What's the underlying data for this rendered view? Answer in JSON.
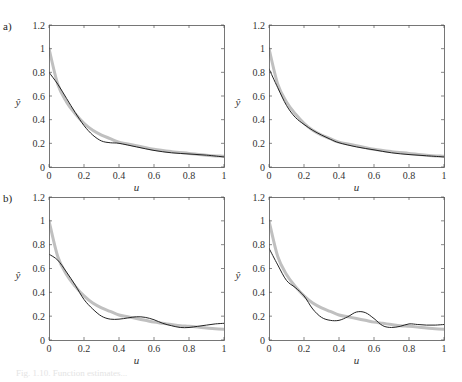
{
  "figure": {
    "panel_labels": [
      "a)",
      "b)"
    ],
    "caption": "Fig. 1.10. Function estimates..."
  },
  "chart_data": [
    {
      "type": "line",
      "panel": "a-left",
      "title": "",
      "xlabel": "u",
      "ylabel": "ŷ",
      "xlim": [
        0,
        1
      ],
      "ylim": [
        0,
        1.2
      ],
      "xticks": [
        "0",
        "0.2",
        "0.4",
        "0.6",
        "0.8",
        "1"
      ],
      "yticks": [
        "0",
        "0.2",
        "0.4",
        "0.6",
        "0.8",
        "1",
        "1.2"
      ],
      "grid": false,
      "x": [
        0,
        0.05,
        0.1,
        0.15,
        0.2,
        0.25,
        0.3,
        0.35,
        0.4,
        0.5,
        0.6,
        0.7,
        0.8,
        0.9,
        1.0
      ],
      "series": [
        {
          "name": "true function",
          "color": "#c0c0c0",
          "width": 3,
          "values": [
            1.0,
            0.7,
            0.55,
            0.45,
            0.37,
            0.31,
            0.27,
            0.24,
            0.21,
            0.18,
            0.15,
            0.13,
            0.115,
            0.1,
            0.09
          ]
        },
        {
          "name": "estimate",
          "color": "#222222",
          "width": 1,
          "values": [
            0.8,
            0.7,
            0.58,
            0.46,
            0.35,
            0.27,
            0.22,
            0.205,
            0.2,
            0.17,
            0.14,
            0.12,
            0.11,
            0.1,
            0.085
          ]
        }
      ]
    },
    {
      "type": "line",
      "panel": "a-right",
      "title": "",
      "xlabel": "u",
      "ylabel": "ŷ",
      "xlim": [
        0,
        1
      ],
      "ylim": [
        0,
        1.2
      ],
      "xticks": [
        "0",
        "0.2",
        "0.4",
        "0.6",
        "0.8",
        "1"
      ],
      "yticks": [
        "0",
        "0.2",
        "0.4",
        "0.6",
        "0.8",
        "1",
        "1.2"
      ],
      "grid": false,
      "x": [
        0,
        0.05,
        0.1,
        0.15,
        0.2,
        0.25,
        0.3,
        0.35,
        0.4,
        0.5,
        0.6,
        0.7,
        0.8,
        0.9,
        1.0
      ],
      "series": [
        {
          "name": "true function",
          "color": "#c0c0c0",
          "width": 3,
          "values": [
            1.0,
            0.7,
            0.55,
            0.45,
            0.37,
            0.31,
            0.27,
            0.24,
            0.21,
            0.18,
            0.15,
            0.13,
            0.115,
            0.1,
            0.09
          ]
        },
        {
          "name": "estimate",
          "color": "#222222",
          "width": 1,
          "values": [
            0.83,
            0.67,
            0.52,
            0.42,
            0.36,
            0.31,
            0.27,
            0.235,
            0.205,
            0.17,
            0.145,
            0.12,
            0.105,
            0.095,
            0.085
          ]
        }
      ]
    },
    {
      "type": "line",
      "panel": "b-left",
      "title": "",
      "xlabel": "u",
      "ylabel": "ŷ",
      "xlim": [
        0,
        1
      ],
      "ylim": [
        0,
        1.2
      ],
      "xticks": [
        "0",
        "0.2",
        "0.4",
        "0.6",
        "0.8",
        "1"
      ],
      "yticks": [
        "0",
        "0.2",
        "0.4",
        "0.6",
        "0.8",
        "1",
        "1.2"
      ],
      "grid": false,
      "x": [
        0,
        0.05,
        0.1,
        0.15,
        0.2,
        0.25,
        0.3,
        0.35,
        0.4,
        0.45,
        0.5,
        0.55,
        0.6,
        0.65,
        0.7,
        0.75,
        0.8,
        0.85,
        0.9,
        0.95,
        1.0
      ],
      "series": [
        {
          "name": "true function",
          "color": "#c0c0c0",
          "width": 3,
          "values": [
            1.0,
            0.7,
            0.55,
            0.45,
            0.37,
            0.31,
            0.27,
            0.24,
            0.21,
            0.195,
            0.18,
            0.165,
            0.15,
            0.14,
            0.13,
            0.12,
            0.115,
            0.108,
            0.1,
            0.095,
            0.09
          ]
        },
        {
          "name": "estimate",
          "color": "#222222",
          "width": 1,
          "values": [
            0.72,
            0.67,
            0.57,
            0.46,
            0.34,
            0.26,
            0.2,
            0.175,
            0.175,
            0.185,
            0.195,
            0.19,
            0.17,
            0.14,
            0.12,
            0.105,
            0.105,
            0.115,
            0.125,
            0.135,
            0.14
          ]
        }
      ]
    },
    {
      "type": "line",
      "panel": "b-right",
      "title": "",
      "xlabel": "u",
      "ylabel": "ŷ",
      "xlim": [
        0,
        1
      ],
      "ylim": [
        0,
        1.2
      ],
      "xticks": [
        "0",
        "0.2",
        "0.4",
        "0.6",
        "0.8",
        "1"
      ],
      "yticks": [
        "0",
        "0.2",
        "0.4",
        "0.6",
        "0.8",
        "1",
        "1.2"
      ],
      "grid": false,
      "x": [
        0,
        0.05,
        0.1,
        0.15,
        0.2,
        0.25,
        0.3,
        0.35,
        0.4,
        0.45,
        0.5,
        0.55,
        0.6,
        0.65,
        0.7,
        0.75,
        0.8,
        0.85,
        0.9,
        0.95,
        1.0
      ],
      "series": [
        {
          "name": "true function",
          "color": "#c0c0c0",
          "width": 3,
          "values": [
            1.0,
            0.7,
            0.55,
            0.45,
            0.37,
            0.31,
            0.27,
            0.24,
            0.21,
            0.195,
            0.18,
            0.165,
            0.15,
            0.14,
            0.13,
            0.12,
            0.115,
            0.108,
            0.1,
            0.095,
            0.09
          ]
        },
        {
          "name": "estimate",
          "color": "#222222",
          "width": 1,
          "values": [
            0.77,
            0.63,
            0.5,
            0.44,
            0.37,
            0.26,
            0.19,
            0.165,
            0.165,
            0.195,
            0.235,
            0.23,
            0.18,
            0.12,
            0.105,
            0.115,
            0.135,
            0.13,
            0.125,
            0.125,
            0.13
          ]
        }
      ]
    }
  ],
  "layout": {
    "panels": [
      {
        "left": 49,
        "top": 25,
        "width": 175,
        "height": 142
      },
      {
        "left": 269,
        "top": 25,
        "width": 175,
        "height": 142
      },
      {
        "left": 49,
        "top": 197,
        "width": 175,
        "height": 143
      },
      {
        "left": 269,
        "top": 197,
        "width": 175,
        "height": 143
      }
    ]
  }
}
